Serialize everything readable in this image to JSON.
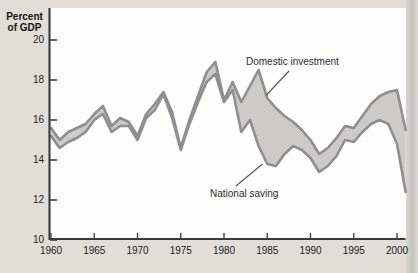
{
  "figure": {
    "ylabel": {
      "line1": "Percent",
      "line2": "of GDP"
    },
    "annotations": {
      "investment_label": "Domestic investment",
      "saving_label": "National saving"
    },
    "colors": {
      "page_bg": "#e0ded7",
      "plot_bg": "#fdfdfa",
      "band_fill": "#cccbc6",
      "line_stroke": "#8e8f8e",
      "axis": "#3a3a3a",
      "pointer_line": "#55524e",
      "text": "#1c1c1c"
    }
  },
  "chart_data": {
    "type": "area",
    "title": "",
    "ylabel": "Percent of GDP",
    "xlabel": "",
    "ylim": [
      10,
      20
    ],
    "xlim": [
      1960,
      2001
    ],
    "grid": false,
    "legend": "inline-annotations",
    "y_ticks": [
      20,
      18,
      16,
      14,
      12,
      10
    ],
    "x_ticks": [
      1960,
      1965,
      1970,
      1975,
      1980,
      1985,
      1990,
      1995,
      2000
    ],
    "x": [
      1960,
      1961,
      1962,
      1963,
      1964,
      1965,
      1966,
      1967,
      1968,
      1969,
      1970,
      1971,
      1972,
      1973,
      1974,
      1975,
      1976,
      1977,
      1978,
      1979,
      1980,
      1981,
      1982,
      1983,
      1984,
      1985,
      1986,
      1987,
      1988,
      1989,
      1990,
      1991,
      1992,
      1993,
      1994,
      1995,
      1996,
      1997,
      1998,
      1999,
      2000,
      2001
    ],
    "series": [
      {
        "name": "Domestic investment",
        "values": [
          15.6,
          15.0,
          15.4,
          15.6,
          15.8,
          16.3,
          16.7,
          15.7,
          16.1,
          15.9,
          15.2,
          16.3,
          16.8,
          17.4,
          16.4,
          14.6,
          16.0,
          17.2,
          18.4,
          18.9,
          17.0,
          17.9,
          16.9,
          17.7,
          18.5,
          17.1,
          16.6,
          16.2,
          15.9,
          15.5,
          15.0,
          14.3,
          14.6,
          15.1,
          15.7,
          15.6,
          16.2,
          16.8,
          17.2,
          17.4,
          17.5,
          15.5
        ]
      },
      {
        "name": "National saving",
        "values": [
          15.2,
          14.6,
          14.9,
          15.1,
          15.4,
          16.0,
          16.3,
          15.4,
          15.7,
          15.7,
          15.0,
          16.1,
          16.5,
          17.3,
          16.1,
          14.5,
          15.8,
          16.9,
          17.9,
          18.3,
          16.9,
          17.5,
          15.4,
          16.0,
          14.7,
          13.8,
          13.7,
          14.3,
          14.7,
          14.5,
          14.1,
          13.4,
          13.7,
          14.2,
          15.0,
          14.9,
          15.4,
          15.8,
          16.0,
          15.8,
          14.8,
          12.4
        ]
      }
    ]
  }
}
